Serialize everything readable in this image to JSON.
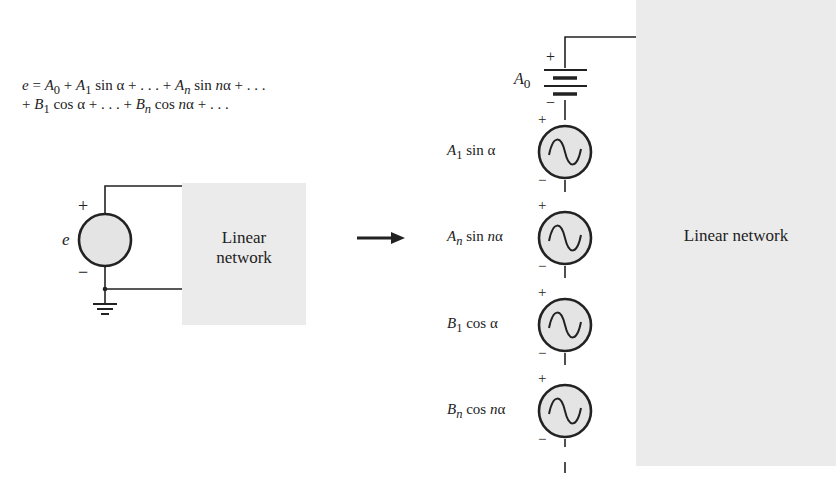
{
  "equation": {
    "line1": "e = A0 + A1 sin α + . . . + An sin nα + . . .",
    "line2": "+ B1 cos α + . . . + Bn cos nα + . . .",
    "parts1": {
      "e": "e",
      "eq": "=",
      "A": "A",
      "s0": "0",
      "plus": "+",
      "s1": "1",
      "sin_a": "sin α",
      "dots": "+ . . . +",
      "sn": "n",
      "sin_na_pre": "sin ",
      "n": "n",
      "alpha": "α",
      "tail": "+ . . ."
    },
    "parts2": {
      "lead": "+ ",
      "B": "B",
      "s1": "1",
      "cos_a": "cos α",
      "dots": "+ . . . +",
      "sn": "n",
      "cos_pre": "cos ",
      "n": "n",
      "alpha": "α",
      "tail": "+ . . ."
    }
  },
  "left_circuit": {
    "source_label": "e",
    "plus": "+",
    "minus": "−",
    "network_label_line1": "Linear",
    "network_label_line2": "network"
  },
  "arrow": {
    "icon": "right-arrow-icon"
  },
  "right_circuit": {
    "network_label": "Linear network",
    "dc_source": {
      "label_main": "A",
      "label_sub": "0",
      "plus": "+",
      "minus": "−"
    },
    "ac_sources": [
      {
        "coef": "A",
        "sub": "1",
        "func": "sin",
        "arg_n": "",
        "arg": "α"
      },
      {
        "coef": "A",
        "sub": "n",
        "func": "sin",
        "arg_n": "n",
        "arg": "α"
      },
      {
        "coef": "B",
        "sub": "1",
        "func": "cos",
        "arg_n": "",
        "arg": "α"
      },
      {
        "coef": "B",
        "sub": "n",
        "func": "cos",
        "arg_n": "n",
        "arg": "α"
      }
    ]
  },
  "colors": {
    "network_fill": "#ebebeb",
    "source_fill": "#e4e4e4",
    "line": "#222222"
  }
}
